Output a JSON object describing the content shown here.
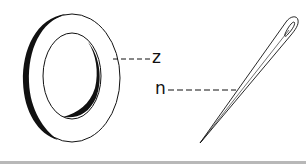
{
  "diagram": {
    "objects": [
      {
        "id": "ring",
        "name": "washer-ring",
        "label": "z"
      },
      {
        "id": "needle",
        "name": "needle",
        "label": "n"
      }
    ],
    "labels": {
      "ring_label": "z",
      "needle_label": "n"
    },
    "colors": {
      "stroke": "#111111",
      "background": "#ffffff",
      "bottom_bar": "#b8b8b8"
    }
  }
}
